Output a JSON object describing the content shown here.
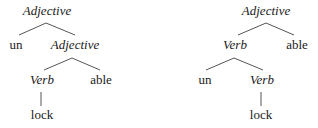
{
  "diagram": {
    "type": "morphological-parse-trees",
    "colors": {
      "line": "#555555",
      "text": "#1a1a1a",
      "background": "#ffffff"
    },
    "trees": [
      {
        "id": "left",
        "nodes": [
          {
            "id": "l-root",
            "label": "Adjective",
            "italic": true,
            "x": 47,
            "y": 4
          },
          {
            "id": "l-un",
            "label": "un",
            "italic": false,
            "x": 16,
            "y": 38
          },
          {
            "id": "l-adj",
            "label": "Adjective",
            "italic": true,
            "x": 75,
            "y": 38
          },
          {
            "id": "l-verb",
            "label": "Verb",
            "italic": true,
            "x": 42,
            "y": 73
          },
          {
            "id": "l-able",
            "label": "able",
            "italic": false,
            "x": 101,
            "y": 73
          },
          {
            "id": "l-lock",
            "label": "lock",
            "italic": false,
            "x": 42,
            "y": 108
          }
        ],
        "edges": [
          {
            "from": "l-root",
            "to": "l-un",
            "x1": 46,
            "y1": 23,
            "x2": 19,
            "y2": 35
          },
          {
            "from": "l-root",
            "to": "l-adj",
            "x1": 46,
            "y1": 23,
            "x2": 75,
            "y2": 35
          },
          {
            "from": "l-adj",
            "to": "l-verb",
            "x1": 72,
            "y1": 58,
            "x2": 44,
            "y2": 70
          },
          {
            "from": "l-adj",
            "to": "l-able",
            "x1": 72,
            "y1": 58,
            "x2": 100,
            "y2": 70
          },
          {
            "from": "l-verb",
            "to": "l-lock",
            "x1": 41,
            "y1": 92,
            "x2": 41,
            "y2": 106
          }
        ]
      },
      {
        "id": "right",
        "nodes": [
          {
            "id": "r-root",
            "label": "Adjective",
            "italic": true,
            "x": 266,
            "y": 4
          },
          {
            "id": "r-verb",
            "label": "Verb",
            "italic": true,
            "x": 235,
            "y": 38
          },
          {
            "id": "r-able",
            "label": "able",
            "italic": false,
            "x": 297,
            "y": 38
          },
          {
            "id": "r-un",
            "label": "un",
            "italic": false,
            "x": 205,
            "y": 73
          },
          {
            "id": "r-verb2",
            "label": "Verb",
            "italic": true,
            "x": 262,
            "y": 73
          },
          {
            "id": "r-lock",
            "label": "lock",
            "italic": false,
            "x": 261,
            "y": 108
          }
        ],
        "edges": [
          {
            "from": "r-root",
            "to": "r-verb",
            "x1": 266,
            "y1": 23,
            "x2": 238,
            "y2": 35
          },
          {
            "from": "r-root",
            "to": "r-able",
            "x1": 266,
            "y1": 23,
            "x2": 294,
            "y2": 35
          },
          {
            "from": "r-verb",
            "to": "r-un",
            "x1": 234,
            "y1": 58,
            "x2": 206,
            "y2": 70
          },
          {
            "from": "r-verb",
            "to": "r-verb2",
            "x1": 234,
            "y1": 58,
            "x2": 263,
            "y2": 70
          },
          {
            "from": "r-verb2",
            "to": "r-lock",
            "x1": 261,
            "y1": 92,
            "x2": 261,
            "y2": 106
          }
        ]
      }
    ]
  }
}
